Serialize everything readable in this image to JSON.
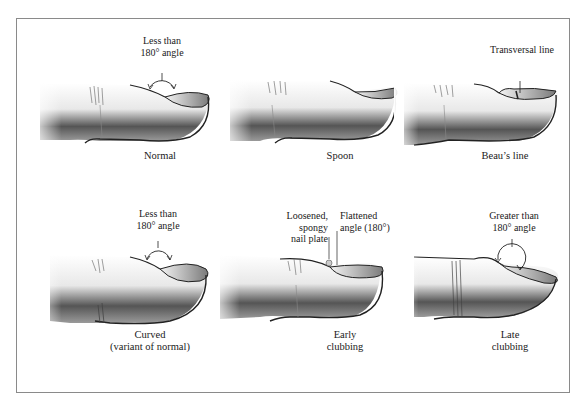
{
  "figure": {
    "panels": [
      {
        "id": "normal",
        "caption": [
          "Normal"
        ],
        "annotations": [
          {
            "lines": [
              "Less than",
              "180° angle"
            ],
            "type": "angle-arc-less"
          }
        ]
      },
      {
        "id": "spoon",
        "caption": [
          "Spoon"
        ],
        "annotations": []
      },
      {
        "id": "beaus-line",
        "caption": [
          "Beau’s line"
        ],
        "annotations": [
          {
            "lines": [
              "Transversal line"
            ],
            "type": "pointer"
          }
        ]
      },
      {
        "id": "curved",
        "caption": [
          "Curved",
          "(variant of normal)"
        ],
        "annotations": [
          {
            "lines": [
              "Less than",
              "180° angle"
            ],
            "type": "angle-arc-less"
          }
        ]
      },
      {
        "id": "early-clubbing",
        "caption": [
          "Early",
          "clubbing"
        ],
        "annotations": [
          {
            "lines": [
              "Loosened,",
              "spongy",
              "nail plate"
            ],
            "type": "pointer"
          },
          {
            "lines": [
              "Flattened",
              "angle (180°)"
            ],
            "type": "pointer"
          }
        ]
      },
      {
        "id": "late-clubbing",
        "caption": [
          "Late",
          "clubbing"
        ],
        "annotations": [
          {
            "lines": [
              "Greater than",
              "180° angle"
            ],
            "type": "angle-arc-greater"
          }
        ]
      }
    ]
  },
  "colors": {
    "frame": "#8a8a8a",
    "ink": "#1a1a1a",
    "shade": "#555555"
  }
}
